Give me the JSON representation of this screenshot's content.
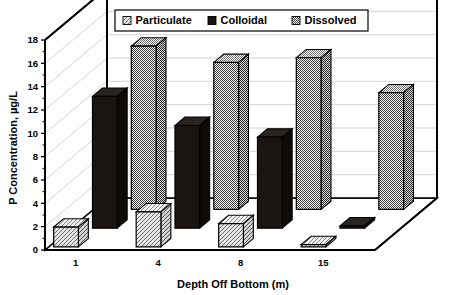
{
  "chart_data": {
    "type": "bar",
    "style": "3d-grouped-column",
    "title": "",
    "xlabel": "Depth Off Bottom (m)",
    "ylabel": "P Concentration, µg/L",
    "categories": [
      "1",
      "4",
      "8",
      "15"
    ],
    "ylim": [
      0,
      18
    ],
    "yticks": [
      "0",
      "2",
      "4",
      "6",
      "8",
      "10",
      "12",
      "14",
      "16",
      "18"
    ],
    "ytick_values": [
      0,
      2,
      4,
      6,
      8,
      10,
      12,
      14,
      16,
      18
    ],
    "grid": true,
    "grid_axis": "y",
    "legend_position": "top-center",
    "series": [
      {
        "name": "Particulate",
        "pattern": "light-diagonal-hatch",
        "color": "#d9d9d9",
        "values": [
          1.7,
          3.0,
          2.0,
          0.2
        ]
      },
      {
        "name": "Colloidal",
        "pattern": "solid-black",
        "color": "#1a1512",
        "values": [
          11.3,
          8.8,
          7.8,
          0.2
        ]
      },
      {
        "name": "Dissolved",
        "pattern": "checkerboard-dither",
        "color": "#9a9a9a",
        "values": [
          14.0,
          12.6,
          13.0,
          10.0
        ]
      }
    ]
  },
  "legend": {
    "items": [
      {
        "label": "Particulate",
        "swatch": "hatch"
      },
      {
        "label": "Colloidal",
        "swatch": "solid"
      },
      {
        "label": "Dissolved",
        "swatch": "check"
      }
    ]
  },
  "axes": {
    "y_title": "P Concentration, µg/L",
    "x_title": "Depth Off Bottom (m)",
    "y_ticks": [
      "18",
      "16",
      "14",
      "12",
      "10",
      "8",
      "6",
      "4",
      "2",
      "0"
    ],
    "x_ticks": [
      "1",
      "4",
      "8",
      "15"
    ]
  },
  "colors": {
    "frame": "#000000",
    "grid": "#c8c8c8",
    "wall": "#ffffff",
    "floor": "#ffffff",
    "dark": "#1a1512",
    "mid": "#9a9a9a",
    "light": "#d9d9d9"
  }
}
